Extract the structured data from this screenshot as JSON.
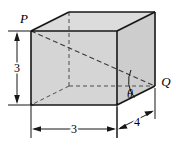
{
  "figure": {
    "type": "geometry-diagram",
    "shape": "rectangular-box",
    "vertex_labels": {
      "p": "P",
      "q": "Q"
    },
    "angle_label": "θ",
    "dimensions": [
      {
        "name": "height",
        "label": "3",
        "orientation": "vertical",
        "side": "left"
      },
      {
        "name": "width",
        "label": "3",
        "orientation": "horizontal",
        "side": "bottom"
      },
      {
        "name": "depth",
        "label": "4",
        "orientation": "oblique",
        "side": "bottom-right"
      }
    ],
    "colors": {
      "face_front": "#d4d4d4",
      "face_right": "#cfcfcf",
      "face_top": "#dcdcdc",
      "edge_solid": "#1a1a1a",
      "edge_hidden": "#555555",
      "dimension_line": "#1a1a1a",
      "background": "#ffffff"
    },
    "geometry": {
      "front_top_left": [
        31,
        31
      ],
      "front_top_right": [
        117,
        31
      ],
      "front_bottom_right": [
        117,
        105
      ],
      "front_bottom_left": [
        31,
        105
      ],
      "back_top_left": [
        69,
        12
      ],
      "back_top_right": [
        155,
        12
      ],
      "back_bottom_right": [
        155,
        86
      ],
      "back_bottom_left": [
        69,
        86
      ]
    }
  }
}
